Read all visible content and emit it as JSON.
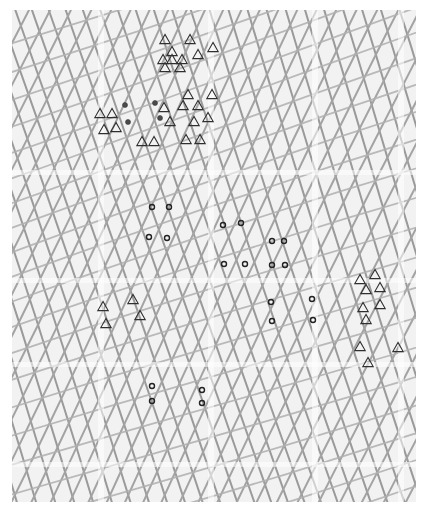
{
  "figure": {
    "kind": "scatter-over-grid",
    "background_color": "#f2f2f2",
    "canvas_color": "#ffffff",
    "plot_left": 12,
    "plot_top": 10,
    "plot_width": 404,
    "plot_height": 492
  },
  "chart_data": {
    "type": "scatter",
    "title": "",
    "subtitle": "",
    "xlabel": "",
    "ylabel": "",
    "xlim": [
      0,
      404
    ],
    "ylim": [
      0,
      492
    ],
    "grid": true,
    "legend_position": "none",
    "tick_labels_x": [],
    "tick_labels_y": [],
    "annotations": [],
    "series": [
      {
        "name": "triangle-cluster-upper",
        "marker": "triangle-open",
        "color": "#2f2f2f",
        "size": 9,
        "points": [
          [
            153,
            30
          ],
          [
            178,
            30
          ],
          [
            160,
            42
          ],
          [
            201,
            38
          ],
          [
            186,
            45
          ],
          [
            151,
            50
          ],
          [
            160,
            50
          ],
          [
            170,
            50
          ],
          [
            153,
            58
          ],
          [
            168,
            58
          ],
          [
            176,
            85
          ],
          [
            200,
            85
          ],
          [
            152,
            98
          ],
          [
            171,
            96
          ],
          [
            186,
            96
          ],
          [
            158,
            112
          ],
          [
            182,
            112
          ],
          [
            196,
            108
          ],
          [
            174,
            130
          ],
          [
            188,
            130
          ],
          [
            88,
            104
          ],
          [
            100,
            104
          ],
          [
            92,
            120
          ],
          [
            104,
            118
          ],
          [
            130,
            132
          ],
          [
            142,
            132
          ]
        ]
      },
      {
        "name": "dot-cluster-upper-left",
        "marker": "circle-filled",
        "color": "#4a4a4a",
        "size": 5,
        "points": [
          [
            113,
            95
          ],
          [
            143,
            93
          ],
          [
            116,
            112
          ],
          [
            148,
            108
          ]
        ]
      },
      {
        "name": "circle-cluster-center",
        "marker": "circle-open",
        "color": "#222222",
        "size": 5,
        "points": [
          [
            140,
            197
          ],
          [
            157,
            197
          ],
          [
            137,
            227
          ],
          [
            155,
            228
          ],
          [
            211,
            215
          ],
          [
            229,
            213
          ],
          [
            212,
            254
          ],
          [
            233,
            254
          ],
          [
            260,
            231
          ],
          [
            272,
            231
          ],
          [
            260,
            255
          ],
          [
            273,
            255
          ]
        ]
      },
      {
        "name": "circle-cluster-lower-right",
        "marker": "circle-open",
        "color": "#222222",
        "size": 5,
        "points": [
          [
            259,
            292
          ],
          [
            300,
            289
          ],
          [
            260,
            311
          ],
          [
            301,
            310
          ]
        ]
      },
      {
        "name": "circle-cluster-lower-left",
        "marker": "circle-open",
        "color": "#222222",
        "size": 5,
        "points": [
          [
            140,
            376
          ],
          [
            140,
            391
          ],
          [
            190,
            380
          ],
          [
            190,
            393
          ]
        ]
      },
      {
        "name": "triangle-cluster-lower-left",
        "marker": "triangle-open",
        "color": "#2f2f2f",
        "size": 9,
        "points": [
          [
            91,
            297
          ],
          [
            121,
            290
          ],
          [
            128,
            306
          ],
          [
            94,
            314
          ]
        ]
      },
      {
        "name": "triangle-cluster-right",
        "marker": "triangle-open",
        "color": "#2f2f2f",
        "size": 9,
        "points": [
          [
            348,
            270
          ],
          [
            363,
            265
          ],
          [
            354,
            280
          ],
          [
            368,
            278
          ],
          [
            351,
            298
          ],
          [
            368,
            295
          ],
          [
            354,
            310
          ],
          [
            348,
            337
          ],
          [
            386,
            338
          ],
          [
            356,
            353
          ]
        ]
      }
    ]
  },
  "grid_layers": [
    {
      "name": "family-a-steep",
      "color": "#9a9a9a",
      "width": 2.0,
      "angle_deg": 72,
      "count": 34,
      "spacing": 17
    },
    {
      "name": "family-b-counter",
      "color": "#a3a3a3",
      "width": 2.0,
      "angle_deg": -64,
      "count": 32,
      "spacing": 18
    },
    {
      "name": "family-c-shallow",
      "color": "#b0b0b0",
      "width": 1.8,
      "angle_deg": -18,
      "count": 22,
      "spacing": 26
    }
  ],
  "bands": {
    "name": "light-seam-bands",
    "color": "#ffffff",
    "opacity": 0.55,
    "vertical_x": [
      86,
      196,
      300,
      386
    ],
    "horizontal_y": [
      160,
      268,
      352,
      452
    ]
  }
}
